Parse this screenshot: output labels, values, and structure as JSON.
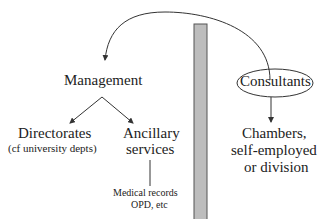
{
  "diagram": {
    "nodes": {
      "management": "Management",
      "directorates": "Directorates",
      "directorates_note": "(cf university depts)",
      "ancillary_line1": "Ancillary",
      "ancillary_line2": "services",
      "ancillary_examples_line1": "Medical records",
      "ancillary_examples_line2": "OPD, etc",
      "consultants": "Consultants",
      "chambers_line1": "Chambers,",
      "chambers_line2": "self-employed",
      "chambers_line3": "or division"
    },
    "edges": [
      {
        "from": "consultants",
        "to": "management",
        "style": "curved-arrow"
      },
      {
        "from": "management",
        "to": "directorates",
        "style": "arrow"
      },
      {
        "from": "management",
        "to": "ancillary",
        "style": "arrow"
      },
      {
        "from": "ancillary",
        "to": "ancillary_examples",
        "style": "line"
      },
      {
        "from": "consultants",
        "to": "chambers",
        "style": "arrow"
      }
    ],
    "divider": {
      "style": "vertical-gray-bar",
      "color": "#b8b8b8"
    }
  }
}
